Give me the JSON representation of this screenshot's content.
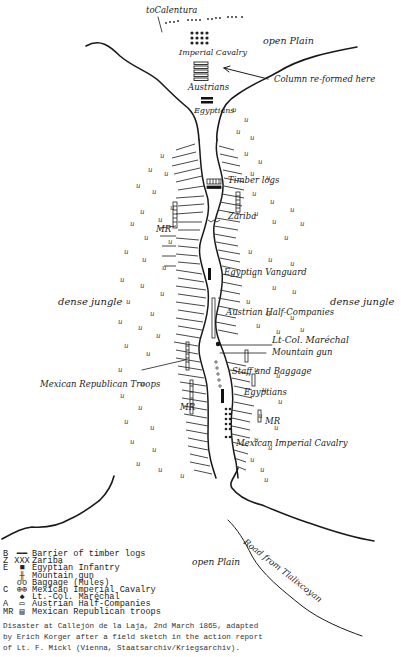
{
  "map": {
    "labels": {
      "to_calentura": "toCalentura",
      "imperial_cavalry": "Imperial Cavalry",
      "open_plain_top": "open Plain",
      "austrians": "Austrians",
      "column_reformed": "Column re-formed here",
      "egyptians_top": "Egyptians",
      "timber_logs": "Timber logs",
      "zariba": "Zariba",
      "mr_left_upper": "MR",
      "egyptian_vanguard": "Egyptian Vanguard",
      "dense_jungle_left": "dense jungle",
      "dense_jungle_right": "dense jungle",
      "austrian_half_companies": "Austrian Half-Companies",
      "lt_col_marechal": "Lt-Col. Maréchal",
      "mountain_gun": "Mountain gun",
      "mexican_republican_troops": "Mexican Republican Troops",
      "staff_and_baggage": "Staff and Baggage",
      "egyptians_bottom": "Egyptians",
      "mr_left_lower": "MR",
      "mr_right": "MR",
      "mexican_imperial_cavalry": "Mexican Imperial Cavalry",
      "open_plain_bottom": "open Plain",
      "road_from": "Road from Tlalixcoyan"
    },
    "colors": {
      "ink": "#1a1a1a",
      "paper": "#ffffff"
    }
  },
  "legend": {
    "items": [
      {
        "key": "B",
        "symbol": "━━",
        "label": "Barrier of timber logs"
      },
      {
        "key": "Z",
        "symbol": "XXX",
        "label": "Zariba"
      },
      {
        "key": "E",
        "symbol": "■",
        "label": "Egyptian Infantry"
      },
      {
        "key": "",
        "symbol": "╫",
        "label": "Mountain gun"
      },
      {
        "key": "",
        "symbol": "oo",
        "label": "Baggage (Mules)"
      },
      {
        "key": "C",
        "symbol": "⊕⊕",
        "label": "Mexican Imperial Cavalry"
      },
      {
        "key": "",
        "symbol": "♠",
        "label": "Lt.-Col. Maréchal"
      },
      {
        "key": "A",
        "symbol": "▭",
        "label": "Austrian Half-Companies"
      },
      {
        "key": "MR",
        "symbol": "▤",
        "label": "Mexican Republican troops"
      }
    ]
  },
  "caption": {
    "line1": "Disaster at Callejón de la Laja, 2nd March 1865, adapted",
    "line2": "by Erich Korger after a field sketch in the action report",
    "line3": "of Lt. F. Mickl (Vienna, Staatsarchiv/Kriegsarchiv)."
  }
}
